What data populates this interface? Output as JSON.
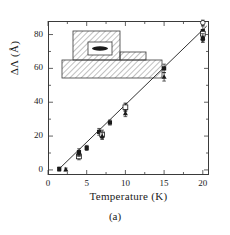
{
  "figure": {
    "caption": "(a)"
  },
  "chart_data": {
    "type": "scatter",
    "title": "",
    "xlabel": "Temperature  (K)",
    "ylabel": "ΔΛ  (Å)",
    "xlim": [
      0,
      20.8
    ],
    "ylim": [
      -3,
      88
    ],
    "grid": false,
    "legend": "none",
    "xticks": [
      0,
      5,
      10,
      15,
      20
    ],
    "xticklabels": [
      "0",
      "5",
      "10",
      "15",
      "20"
    ],
    "xminorticks": [
      2.5,
      7.5,
      12.5,
      17.5
    ],
    "yticks": [
      0,
      20,
      40,
      60,
      80
    ],
    "yticklabels": [
      "0",
      "20",
      "40",
      "60",
      "80"
    ],
    "yminorticks": [
      10,
      30,
      50,
      70
    ],
    "fit_line": {
      "type": "line",
      "x": [
        1.3,
        20.5
      ],
      "y": [
        0,
        85
      ],
      "slope": 4.43,
      "intercept": -5.75
    },
    "series": [
      {
        "name": "filled-square",
        "marker": "filled-square",
        "points": [
          {
            "x": 1.45,
            "y": 0.5,
            "yerr": 1.2
          },
          {
            "x": 4.0,
            "y": 10.5,
            "yerr": 2.0
          },
          {
            "x": 5.0,
            "y": 13.0,
            "yerr": 1.5
          },
          {
            "x": 6.6,
            "y": 22.5,
            "yerr": 2.0
          },
          {
            "x": 8.0,
            "y": 28.0,
            "yerr": 1.5
          },
          {
            "x": 10.0,
            "y": 37.0,
            "yerr": 2.5
          },
          {
            "x": 15.0,
            "y": 60.0,
            "yerr": 2.5
          },
          {
            "x": 20.0,
            "y": 82.0,
            "yerr": 3.0
          },
          {
            "x": 20.0,
            "y": 77.5,
            "yerr": 2.0
          }
        ]
      },
      {
        "name": "open-square",
        "marker": "open-square",
        "points": [
          {
            "x": 4.0,
            "y": 8.0,
            "yerr": 2.0
          },
          {
            "x": 7.0,
            "y": 21.0,
            "yerr": 2.5
          },
          {
            "x": 10.0,
            "y": 37.0,
            "yerr": 2.0
          },
          {
            "x": 20.0,
            "y": 80.5,
            "yerr": 2.5
          }
        ]
      },
      {
        "name": "filled-triangle",
        "marker": "filled-triangle",
        "points": [
          {
            "x": 2.3,
            "y": 0.3,
            "yerr": 0.8
          },
          {
            "x": 4.0,
            "y": 9.5,
            "yerr": 1.5
          },
          {
            "x": 7.0,
            "y": 20.0,
            "yerr": 2.0
          },
          {
            "x": 10.0,
            "y": 33.5,
            "yerr": 2.0
          },
          {
            "x": 15.0,
            "y": 55.0,
            "yerr": 2.5
          },
          {
            "x": 20.0,
            "y": 78.0,
            "yerr": 2.5
          }
        ]
      },
      {
        "name": "open-circle",
        "marker": "open-circle",
        "points": [
          {
            "x": 20.0,
            "y": 87.0,
            "yerr": 1.5
          }
        ]
      }
    ],
    "inset": {
      "name": "device-cross-section-schematic",
      "description": "hatched ridge waveguide cross-section with active region",
      "elements": [
        {
          "name": "substrate-hatched-layer"
        },
        {
          "name": "ridge-hatched-block"
        },
        {
          "name": "active-region-white-window"
        },
        {
          "name": "quantum-well-ellipse"
        },
        {
          "name": "side-contact-hatched-step"
        }
      ]
    }
  }
}
